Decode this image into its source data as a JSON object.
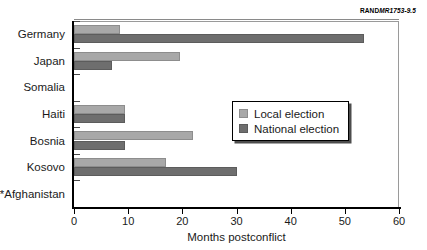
{
  "figure": {
    "source_code_brand": "RAND",
    "source_code_number": "MR1753-9.5"
  },
  "legend": {
    "items": [
      {
        "label": "Local election",
        "color": "#a8a8a8"
      },
      {
        "label": "National election",
        "color": "#6e6e6e"
      }
    ]
  },
  "chart_data": {
    "type": "bar",
    "orientation": "horizontal",
    "title": "",
    "xlabel": "Months postconflict",
    "ylabel": "",
    "xlim": [
      0,
      60
    ],
    "xticks": [
      0,
      10,
      20,
      30,
      40,
      50,
      60
    ],
    "grid": false,
    "legend_position": "center-right",
    "categories": [
      "Germany",
      "Japan",
      "Somalia",
      "Haiti",
      "Bosnia",
      "Kosovo",
      "*Afghanistan"
    ],
    "series": [
      {
        "name": "Local election",
        "color": "#a8a8a8",
        "values": [
          8.5,
          19.5,
          0,
          9.5,
          22,
          17,
          0
        ]
      },
      {
        "name": "National election",
        "color": "#6e6e6e",
        "values": [
          53.5,
          7,
          0,
          9.5,
          9.5,
          30,
          0
        ]
      }
    ]
  }
}
